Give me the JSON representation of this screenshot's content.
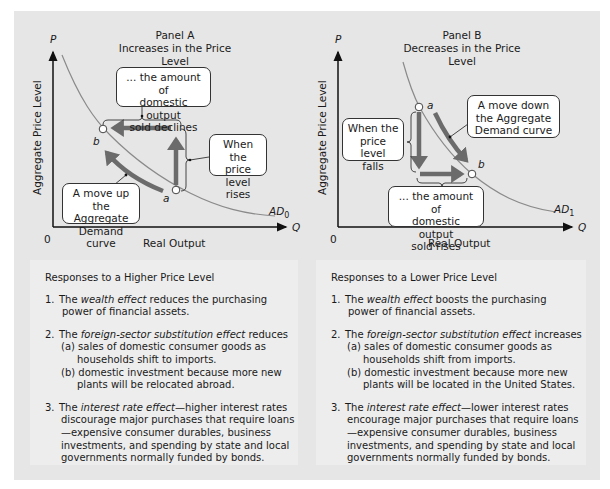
{
  "panel_a": {
    "title_line1": "Panel A",
    "title_line2": "Increases in the Price Level",
    "y_axis_symbol": "P",
    "x_axis_symbol": "Q",
    "origin": "0",
    "y_axis_label": "Aggregate Price Level",
    "x_axis_label": "Real Output",
    "curve_label": "AD",
    "curve_subscript": "0",
    "point_a": "a",
    "point_b": "b",
    "callout_top": [
      "... the amount of",
      "domestic output",
      "sold declines"
    ],
    "callout_right": [
      "When the",
      "price level",
      "rises"
    ],
    "callout_bottom": [
      "A move up",
      "the Aggregate",
      "Demand curve"
    ]
  },
  "panel_b": {
    "title_line1": "Panel B",
    "title_line2": "Decreases in the Price Level",
    "y_axis_symbol": "P",
    "x_axis_symbol": "Q",
    "origin": "0",
    "y_axis_label": "Aggregate Price Level",
    "x_axis_label": "Real Output",
    "curve_label": "AD",
    "curve_subscript": "1",
    "point_a": "a",
    "point_b": "b",
    "callout_left": [
      "When the",
      "price level",
      "falls"
    ],
    "callout_right": [
      "A move down",
      "the Aggregate",
      "Demand curve"
    ],
    "callout_bottom": [
      "... the amount of",
      "domestic output",
      "sold rises"
    ]
  },
  "higher": {
    "title": "Responses to a Higher Price Level",
    "item1": {
      "num": "1.",
      "pre": "The ",
      "em": "wealth effect",
      "post": " reduces the purchasing",
      "cont": "power of financial assets."
    },
    "item2": {
      "num": "2.",
      "pre": "The ",
      "em": "foreign-sector substitution effect",
      "post": " reduces",
      "a1": "(a) sales of domestic consumer goods  as",
      "a2": "households shift to imports.",
      "b1": "(b) domestic investment because more new",
      "b2": "plants will be relocated abroad."
    },
    "item3": {
      "num": "3.",
      "pre": "The ",
      "em": "interest rate effect",
      "post": "—higher interest rates",
      "l2": "discourage major purchases that require loans",
      "l3": "—expensive consumer durables, business",
      "l4": "investments, and spending by state and local",
      "l5": "governments normally funded by bonds."
    }
  },
  "lower": {
    "title": "Responses to a Lower Price Level",
    "item1": {
      "num": "1.",
      "pre": "The ",
      "em": "wealth effect",
      "post": " boosts the purchasing",
      "cont": "power of financial assets."
    },
    "item2": {
      "num": "2.",
      "pre": "The ",
      "em": "foreign-sector substitution effect",
      "post": " increases",
      "a1": "(a) sales of domestic consumer goods as",
      "a2": "households shift from imports.",
      "b1": "(b) domestic investment because more new",
      "b2": "plants will be located in the United States."
    },
    "item3": {
      "num": "3.",
      "pre": "The ",
      "em": "interest rate effect",
      "post": "—lower interest rates",
      "l2": "encourage major purchases that require loans",
      "l3": "—expensive consumer durables, business",
      "l4": "investments, and spending by state and local",
      "l5": "governments normally funded by bonds."
    }
  },
  "colors": {
    "frame_bg": "#e6e6e6",
    "arrow": "#6b6b6b",
    "curve": "#8a8a8a",
    "axis": "#111111"
  }
}
